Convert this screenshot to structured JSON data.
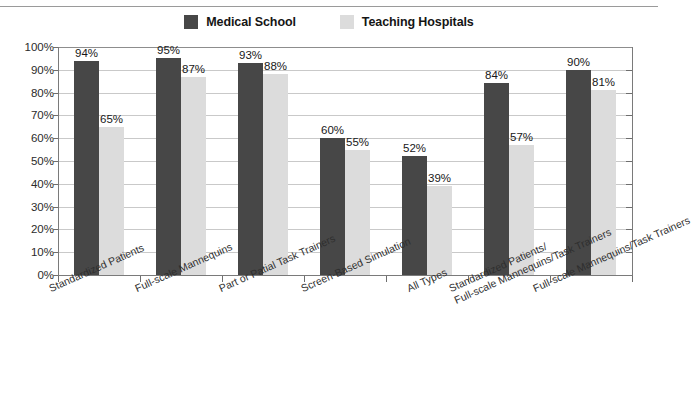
{
  "chart_data": {
    "type": "bar",
    "title": "",
    "subtitle": "",
    "xlabel": "",
    "ylabel": "",
    "ylim": [
      0,
      100
    ],
    "ytick_labels": [
      "100%",
      "90%",
      "80%",
      "70%",
      "60%",
      "50%",
      "40%",
      "30%",
      "20%",
      "10%",
      "0%"
    ],
    "ytick_values": [
      100,
      90,
      80,
      70,
      60,
      50,
      40,
      30,
      20,
      10,
      0
    ],
    "grid": true,
    "legend_position": "top-center",
    "categories": [
      "Standardized Patients",
      "Full-scale Mannequins",
      "Part or Patial Task Trainers",
      "Screen-Based Simulation",
      "All Types",
      "Standardized Patients/\nFull-scale Mannequins/Task Trainers",
      "Full-scale Mannequins/Task Trainers"
    ],
    "series": [
      {
        "name": "Medical School",
        "color": "#474747",
        "values": [
          94,
          95,
          93,
          60,
          52,
          84,
          90
        ],
        "value_labels": [
          "94%",
          "95%",
          "93%",
          "60%",
          "52%",
          "84%",
          "90%"
        ]
      },
      {
        "name": "Teaching Hospitals",
        "color": "#dcdcdc",
        "values": [
          65,
          87,
          88,
          55,
          39,
          57,
          81
        ],
        "value_labels": [
          "65%",
          "87%",
          "88%",
          "55%",
          "39%",
          "57%",
          "81%"
        ]
      }
    ]
  },
  "legend": {
    "entries": [
      {
        "label": "Medical School",
        "color": "#474747"
      },
      {
        "label": "Teaching Hospitals",
        "color": "#dcdcdc"
      }
    ]
  }
}
